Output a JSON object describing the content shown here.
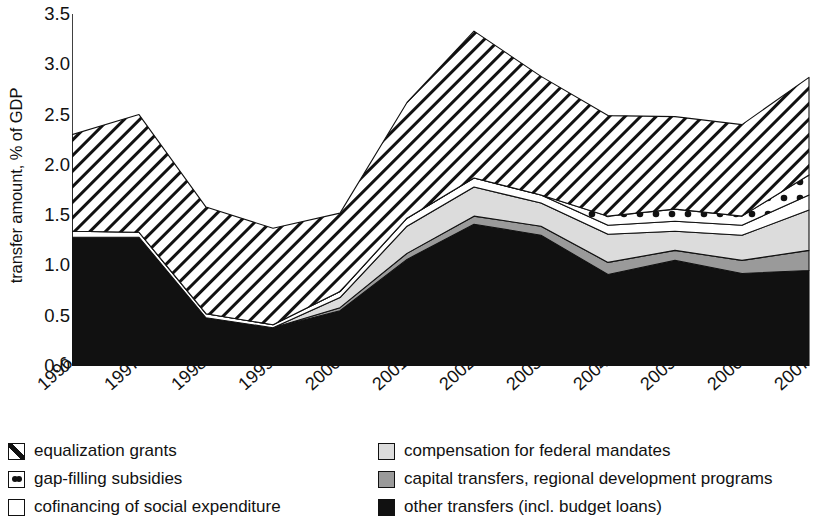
{
  "chart_data": {
    "type": "area",
    "title": "",
    "subtitle": "",
    "xlabel": "",
    "ylabel": "transfer amount, % of GDP",
    "categories": [
      "1996",
      "1997",
      "1998",
      "1999",
      "2000",
      "2001",
      "2002",
      "2003",
      "2004",
      "2005",
      "2006",
      "2007"
    ],
    "x": [
      1996,
      1997,
      1998,
      1999,
      2000,
      2001,
      2002,
      2003,
      2004,
      2005,
      2006,
      2007
    ],
    "ylim": [
      0.0,
      3.5
    ],
    "yticks": [
      "0.0",
      "0.5",
      "1.0",
      "1.5",
      "2.0",
      "2.5",
      "3.0",
      "3.5"
    ],
    "ytick_values": [
      0.0,
      0.5,
      1.0,
      1.5,
      2.0,
      2.5,
      3.0,
      3.5
    ],
    "grid": false,
    "stacked": true,
    "legend_position": "below",
    "stack_order_bottom_to_top": [
      "other transfers (incl. budget loans)",
      "capital transfers, regional development programs",
      "compensation for federal mandates",
      "cofinancing of social expenditure",
      "gap-filling subsidies",
      "equalization grants"
    ],
    "series": [
      {
        "name": "other transfers (incl. budget loans)",
        "pattern": "solid-black",
        "color": "#111111",
        "values": [
          1.28,
          1.28,
          0.48,
          0.38,
          0.55,
          1.06,
          1.41,
          1.3,
          0.91,
          1.05,
          0.92,
          0.95
        ]
      },
      {
        "name": "capital transfers, regional development programs",
        "pattern": "solid-mid-gray",
        "color": "#9a9a9a",
        "values": [
          0.0,
          0.0,
          0.0,
          0.0,
          0.03,
          0.06,
          0.08,
          0.09,
          0.12,
          0.1,
          0.13,
          0.2
        ]
      },
      {
        "name": "compensation for federal mandates",
        "pattern": "solid-light-gray",
        "color": "#dcdcdc",
        "values": [
          0.0,
          0.0,
          0.0,
          0.0,
          0.1,
          0.27,
          0.29,
          0.23,
          0.28,
          0.19,
          0.25,
          0.4
        ]
      },
      {
        "name": "cofinancing of social expenditure",
        "pattern": "white",
        "color": "#ffffff",
        "values": [
          0.06,
          0.05,
          0.04,
          0.03,
          0.06,
          0.08,
          0.09,
          0.08,
          0.09,
          0.1,
          0.1,
          0.15
        ]
      },
      {
        "name": "gap-filling subsidies",
        "pattern": "dotted",
        "color": "#ffffff",
        "values": [
          0.0,
          0.0,
          0.0,
          0.0,
          0.0,
          0.0,
          0.0,
          0.0,
          0.09,
          0.12,
          0.09,
          0.2
        ]
      },
      {
        "name": "equalization grants",
        "pattern": "diagonal-hatch",
        "color": "#ffffff",
        "values": [
          0.96,
          1.17,
          1.06,
          0.96,
          0.78,
          1.15,
          1.46,
          1.18,
          1.0,
          0.92,
          0.91,
          0.97
        ]
      }
    ],
    "cumulative_tops": {
      "other transfers (incl. budget loans)": [
        1.28,
        1.28,
        0.48,
        0.38,
        0.55,
        1.06,
        1.41,
        1.3,
        0.91,
        1.05,
        0.92,
        0.95
      ],
      "capital transfers, regional development programs": [
        1.28,
        1.28,
        0.48,
        0.38,
        0.58,
        1.12,
        1.49,
        1.39,
        1.03,
        1.15,
        1.05,
        1.15
      ],
      "compensation for federal mandates": [
        1.28,
        1.28,
        0.48,
        0.38,
        0.68,
        1.39,
        1.78,
        1.62,
        1.31,
        1.34,
        1.3,
        1.55
      ],
      "cofinancing of social expenditure": [
        1.34,
        1.33,
        0.52,
        0.41,
        0.74,
        1.47,
        1.87,
        1.7,
        1.4,
        1.44,
        1.4,
        1.7
      ],
      "gap-filling subsidies": [
        1.34,
        1.33,
        0.52,
        0.41,
        0.74,
        1.47,
        1.87,
        1.7,
        1.49,
        1.56,
        1.49,
        1.9
      ],
      "equalization grants": [
        2.3,
        2.5,
        1.58,
        1.37,
        1.52,
        2.62,
        3.33,
        2.88,
        2.49,
        2.48,
        2.4,
        2.87
      ]
    },
    "totals": [
      2.3,
      2.5,
      1.58,
      1.37,
      1.52,
      2.62,
      3.33,
      2.88,
      2.49,
      2.48,
      2.4,
      2.87
    ],
    "annotations": []
  },
  "axes": {
    "ylabel": "transfer amount, % of GDP",
    "ytick_labels": [
      "3.5",
      "3.0",
      "2.5",
      "2.0",
      "1.5",
      "1.0",
      "0.5",
      "0.0"
    ],
    "xtick_labels": [
      "1996",
      "1997",
      "1998",
      "1999",
      "2000",
      "2001",
      "2002",
      "2003",
      "2004",
      "2005",
      "2006",
      "2007"
    ]
  },
  "legend": {
    "left_column": [
      {
        "label": "equalization grants",
        "swatch": "hatch-swatch-icon"
      },
      {
        "label": "gap-filling subsidies",
        "swatch": "dotted-swatch-icon"
      },
      {
        "label": "cofinancing of social expenditure",
        "swatch": "white-swatch-icon"
      }
    ],
    "right_column": [
      {
        "label": "compensation for federal mandates",
        "swatch": "light-gray-swatch-icon"
      },
      {
        "label": "capital transfers, regional development programs",
        "swatch": "mid-gray-swatch-icon"
      },
      {
        "label": "other transfers (incl. budget loans)",
        "swatch": "black-swatch-icon"
      }
    ]
  },
  "colors": {
    "axis": "#111111",
    "black_layer": "#111111",
    "mid_gray_layer": "#9a9a9a",
    "light_gray_layer": "#dcdcdc",
    "white_layer": "#ffffff",
    "background": "#ffffff"
  }
}
